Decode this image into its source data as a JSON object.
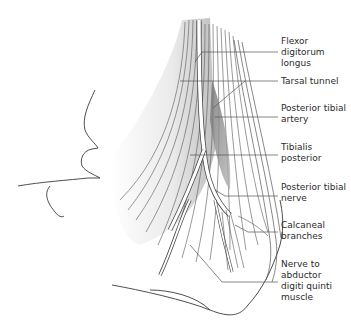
{
  "figure": {
    "labels": [
      {
        "id": "flexor-digitorum-longus",
        "text": "Flexor digitorum\nlongus"
      },
      {
        "id": "tarsal-tunnel",
        "text": "Tarsal tunnel"
      },
      {
        "id": "posterior-tibial-artery",
        "text": "Posterior tibial\nartery"
      },
      {
        "id": "tibialis-posterior",
        "text": "Tibialis\nposterior"
      },
      {
        "id": "posterior-tibial-nerve",
        "text": "Posterior tibial\nnerve"
      },
      {
        "id": "calcaneal-branches",
        "text": "Calcaneal\nbranches"
      },
      {
        "id": "nerve-to-abductor-digiti-quinti",
        "text": "Nerve to\nabductor\ndigiti quinti\nmuscle"
      }
    ]
  }
}
